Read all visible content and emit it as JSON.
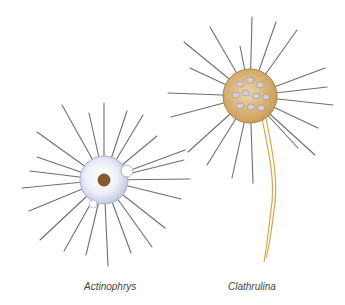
{
  "figure": {
    "organisms": [
      {
        "name": "Actinophrys",
        "label": "Actinophrys",
        "body_color": "#dfe3f0",
        "nucleus_color": "#8a5a2a"
      },
      {
        "name": "Clathrulina",
        "label": "Clathrulina",
        "body_color": "#d9b77a",
        "stalk_color": "#d9a74a"
      }
    ],
    "spine_color": "#6e6e78"
  }
}
